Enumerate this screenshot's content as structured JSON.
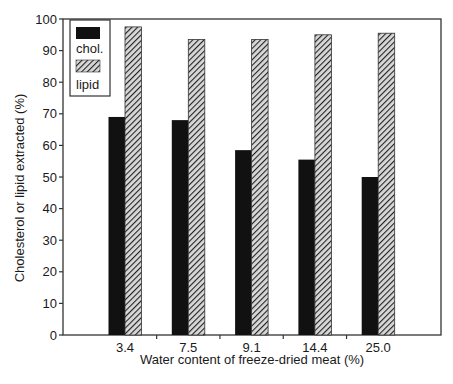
{
  "chart_data": {
    "type": "bar",
    "title": "",
    "xlabel": "Water content of freeze-dried meat (%)",
    "ylabel": "Cholesterol or lipid extracted (%)",
    "categories": [
      "3.4",
      "7.5",
      "9.1",
      "14.4",
      "25.0"
    ],
    "series": [
      {
        "name": "chol.",
        "style": "solid-black",
        "color": "#111111",
        "values": [
          69,
          68,
          58.5,
          55.5,
          50
        ]
      },
      {
        "name": "lipid",
        "style": "diagonal-hatch",
        "color": "#555555",
        "values": [
          97.5,
          93.5,
          93.5,
          95,
          95.5
        ]
      }
    ],
    "ylim": [
      0,
      100
    ],
    "yticks": [
      0,
      10,
      20,
      30,
      40,
      50,
      60,
      70,
      80,
      90,
      100
    ],
    "grid": false,
    "legend_position": "upper-left-inside"
  },
  "legend": {
    "items": [
      {
        "label": "chol."
      },
      {
        "label": "lipid"
      }
    ]
  }
}
